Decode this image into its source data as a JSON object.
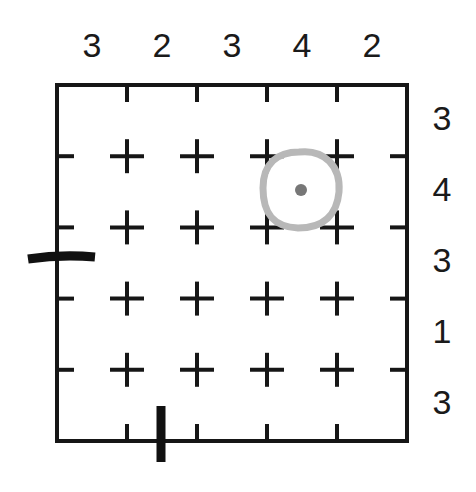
{
  "puzzle": {
    "type": "grid-clue-puzzle",
    "grid": {
      "columns": 5,
      "rows": 5,
      "left": 57,
      "top": 85,
      "cell_size": 70,
      "width": 350,
      "height": 356
    },
    "clues": {
      "top": [
        "3",
        "2",
        "3",
        "4",
        "2"
      ],
      "right": [
        "3",
        "4",
        "3",
        "1",
        "3"
      ]
    },
    "marks": [
      {
        "name": "left-edge-dash",
        "kind": "horizontal-dash",
        "x1": 28,
        "y1": 259,
        "x2": 95,
        "y2": 257
      },
      {
        "name": "bottom-edge-bar",
        "kind": "vertical-bar",
        "x1": 161,
        "y1": 406,
        "x2": 161,
        "y2": 462
      }
    ],
    "annotation": {
      "name": "highlight-ring",
      "shape": "rounded-square-ring",
      "cell_col": 4,
      "cell_row": 2,
      "center_x": 301,
      "center_y": 190,
      "radius": 38,
      "dot_radius": 6,
      "ring_color": "#b8b8b8",
      "dot_color": "#777777"
    },
    "colors": {
      "ink": "#161616",
      "background": "#ffffff",
      "mark": "#111111",
      "annotation": "#b8b8b8"
    }
  }
}
